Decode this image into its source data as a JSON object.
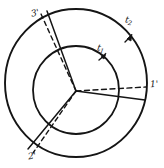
{
  "figure": {
    "background_color": "#ffffff",
    "ink_color": "#151515",
    "outer_circle": {
      "cx": 76,
      "cy": 83,
      "r": 71,
      "style": "solid"
    },
    "inner_circle": {
      "cx": 76,
      "cy": 90,
      "r": 43,
      "style": "solid"
    },
    "center_dot": {
      "cx": 76,
      "cy": 91
    },
    "labels": {
      "spoke_1_solid": "1",
      "spoke_1_dashed": "1'",
      "spoke_2_solid": "2",
      "spoke_2_dashed": "2'",
      "spoke_3_solid": "3",
      "spoke_3_dashed": "3'",
      "arrow_inner_letter": "t",
      "arrow_inner_sub": "1",
      "arrow_outer_letter": "t",
      "arrow_outer_sub": "2"
    },
    "spokes": [
      {
        "name": "spoke-1",
        "label": "1",
        "style": "solid",
        "angle_deg": 10
      },
      {
        "name": "spoke-1-prime",
        "label": "1'",
        "style": "dashed",
        "angle_deg": 0
      },
      {
        "name": "spoke-2",
        "label": "2",
        "style": "solid",
        "angle_deg": 228
      },
      {
        "name": "spoke-2-prime",
        "label": "2'",
        "style": "dashed",
        "angle_deg": 234
      },
      {
        "name": "spoke-3",
        "label": "3",
        "style": "solid",
        "angle_deg": 113
      },
      {
        "name": "spoke-3-prime",
        "label": "3'",
        "style": "dashed",
        "angle_deg": 118
      }
    ],
    "arrows": [
      {
        "name": "inner-tangent-arrow",
        "on": "inner_circle",
        "label": "t1"
      },
      {
        "name": "outer-tangent-arrow",
        "on": "outer_circle",
        "label": "t2"
      }
    ]
  }
}
